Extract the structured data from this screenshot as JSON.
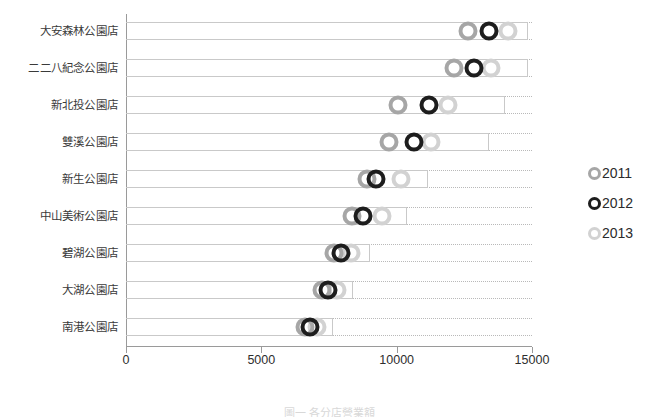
{
  "chart_data": {
    "type": "scatter",
    "title": "",
    "subtitle": "",
    "xlabel": "",
    "ylabel": "",
    "orientation": "horizontal",
    "grid": true,
    "legend_position": "right",
    "xlim": [
      0,
      15000
    ],
    "xticks": [
      0,
      5000,
      10000,
      15000
    ],
    "xtick_labels": [
      "0",
      "5000",
      "10000",
      "15000"
    ],
    "categories": [
      "大安森林公園店",
      "二二八紀念公園店",
      "新北投公園店",
      "雙溪公園店",
      "新生公園店",
      "中山美術公園店",
      "碧湖公園店",
      "大湖公園店",
      "南港公園店"
    ],
    "series": [
      {
        "name": "2011",
        "color": "#a6a6a6",
        "values": [
          12650,
          12100,
          10050,
          9700,
          8900,
          8350,
          7700,
          7250,
          6600
        ]
      },
      {
        "name": "2012",
        "color": "#1d1d1d",
        "values": [
          13400,
          12850,
          11200,
          10650,
          9250,
          8750,
          7950,
          7450,
          6800
        ]
      },
      {
        "name": "2013",
        "color": "#d2d2d2",
        "values": [
          14100,
          13500,
          11900,
          11250,
          10150,
          9450,
          8300,
          7800,
          7050
        ]
      }
    ],
    "row_extent": [
      14850,
      14850,
      14000,
      13400,
      11150,
      10400,
      9000,
      8400,
      7650
    ]
  },
  "legend": {
    "items": [
      {
        "label": "2011",
        "icon": "circle-marker-icon"
      },
      {
        "label": "2012",
        "icon": "circle-marker-icon"
      },
      {
        "label": "2013",
        "icon": "circle-marker-icon"
      }
    ]
  },
  "caption": {
    "text": "圖一 各分店營業額"
  }
}
